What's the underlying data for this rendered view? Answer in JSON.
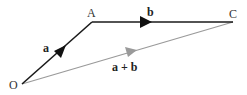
{
  "diagram": {
    "points": {
      "O": {
        "label": "O",
        "x": 22,
        "y": 84
      },
      "A": {
        "label": "A",
        "x": 92,
        "y": 22
      },
      "C": {
        "label": "C",
        "x": 233,
        "y": 22
      }
    },
    "vectors": [
      {
        "id": "a",
        "label": "a",
        "from": "O",
        "to": "A",
        "color": "#1a1a1a"
      },
      {
        "id": "b",
        "label": "b",
        "from": "A",
        "to": "C",
        "color": "#1a1a1a"
      },
      {
        "id": "a_plus_b",
        "label": "a + b",
        "from": "O",
        "to": "C",
        "color": "#999999"
      }
    ],
    "colors": {
      "primary_vector": "#1a1a1a",
      "resultant_vector": "#999999",
      "background": "#ffffff"
    }
  }
}
